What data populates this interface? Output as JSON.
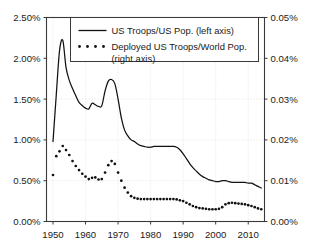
{
  "chart_data": {
    "type": "line",
    "title": "",
    "subtitle": "",
    "xlabel": "",
    "ylabel": "",
    "xlim": [
      1948,
      2015
    ],
    "grid": true,
    "legend_position": "top-center",
    "x_ticks": [
      "1950",
      "1960",
      "1970",
      "1980",
      "1990",
      "2000",
      "2010"
    ],
    "x_tick_values": [
      1950,
      1960,
      1970,
      1980,
      1990,
      2000,
      2010
    ],
    "left_axis": {
      "label": "",
      "ylim": [
        0.0,
        2.5
      ],
      "unit": "%",
      "ticks": [
        "0.00%",
        "0.50%",
        "1.00%",
        "1.50%",
        "2.00%",
        "2.50%"
      ],
      "tick_values": [
        0.0,
        0.5,
        1.0,
        1.5,
        2.0,
        2.5
      ]
    },
    "right_axis": {
      "label": "",
      "ylim": [
        0.0,
        0.05
      ],
      "unit": "%",
      "ticks": [
        "0.00%",
        "0.01%",
        "0.02%",
        "0.03%",
        "0.04%",
        "0.05%"
      ],
      "tick_values": [
        0.0,
        0.01,
        0.02,
        0.03,
        0.04,
        0.05
      ]
    },
    "series": [
      {
        "name": "US Troops/US Pop. (left axis)",
        "axis": "left",
        "style": "solid-line",
        "x": [
          1950,
          1951,
          1952,
          1953,
          1954,
          1955,
          1956,
          1957,
          1958,
          1959,
          1960,
          1961,
          1962,
          1963,
          1964,
          1965,
          1966,
          1967,
          1968,
          1969,
          1970,
          1971,
          1972,
          1973,
          1974,
          1975,
          1976,
          1977,
          1978,
          1979,
          1980,
          1981,
          1982,
          1983,
          1984,
          1985,
          1986,
          1987,
          1988,
          1989,
          1990,
          1991,
          1992,
          1993,
          1994,
          1995,
          1996,
          1997,
          1998,
          1999,
          2000,
          2001,
          2002,
          2003,
          2004,
          2005,
          2006,
          2007,
          2008,
          2009,
          2010,
          2011,
          2012,
          2013,
          2014
        ],
        "values": [
          0.98,
          1.55,
          2.09,
          2.22,
          1.89,
          1.73,
          1.63,
          1.54,
          1.46,
          1.42,
          1.39,
          1.38,
          1.45,
          1.43,
          1.41,
          1.42,
          1.6,
          1.72,
          1.74,
          1.69,
          1.5,
          1.27,
          1.12,
          1.05,
          1.0,
          0.98,
          0.95,
          0.93,
          0.92,
          0.91,
          0.91,
          0.92,
          0.92,
          0.92,
          0.92,
          0.92,
          0.92,
          0.92,
          0.91,
          0.88,
          0.83,
          0.77,
          0.71,
          0.66,
          0.62,
          0.58,
          0.55,
          0.53,
          0.51,
          0.5,
          0.49,
          0.49,
          0.5,
          0.5,
          0.49,
          0.48,
          0.48,
          0.48,
          0.48,
          0.48,
          0.47,
          0.47,
          0.45,
          0.43,
          0.41
        ]
      },
      {
        "name": "Deployed US Troops/World Pop. (right axis)",
        "axis": "right",
        "style": "dotted-markers",
        "x": [
          1950,
          1951,
          1952,
          1953,
          1954,
          1955,
          1956,
          1957,
          1958,
          1959,
          1960,
          1961,
          1962,
          1963,
          1964,
          1965,
          1966,
          1967,
          1968,
          1969,
          1970,
          1971,
          1972,
          1973,
          1974,
          1975,
          1976,
          1977,
          1978,
          1979,
          1980,
          1981,
          1982,
          1983,
          1984,
          1985,
          1986,
          1987,
          1988,
          1989,
          1990,
          1991,
          1992,
          1993,
          1994,
          1995,
          1996,
          1997,
          1998,
          1999,
          2000,
          2001,
          2002,
          2003,
          2004,
          2005,
          2006,
          2007,
          2008,
          2009,
          2010,
          2011,
          2012,
          2013,
          2014
        ],
        "values": [
          0.0114,
          0.016,
          0.0172,
          0.0185,
          0.0175,
          0.0163,
          0.0148,
          0.0136,
          0.0126,
          0.0117,
          0.011,
          0.0104,
          0.0107,
          0.0108,
          0.0103,
          0.0104,
          0.012,
          0.0138,
          0.0148,
          0.0141,
          0.012,
          0.01,
          0.0083,
          0.0071,
          0.0062,
          0.0058,
          0.0056,
          0.0055,
          0.0055,
          0.0055,
          0.0055,
          0.0055,
          0.0055,
          0.0055,
          0.0055,
          0.0055,
          0.0055,
          0.0055,
          0.0054,
          0.0052,
          0.005,
          0.0046,
          0.0042,
          0.0038,
          0.0035,
          0.0033,
          0.0032,
          0.0031,
          0.003,
          0.003,
          0.003,
          0.0031,
          0.0035,
          0.0042,
          0.0045,
          0.0046,
          0.0045,
          0.0044,
          0.0043,
          0.0042,
          0.004,
          0.0038,
          0.0035,
          0.0032,
          0.003
        ]
      }
    ],
    "legend": [
      {
        "label_line1": "US Troops/US Pop. (left axis)",
        "label_line2": "",
        "marker": "solid-line"
      },
      {
        "label_line1": "Deployed US Troops/World Pop.",
        "label_line2": "(right axis)",
        "marker": "dotted"
      }
    ]
  }
}
